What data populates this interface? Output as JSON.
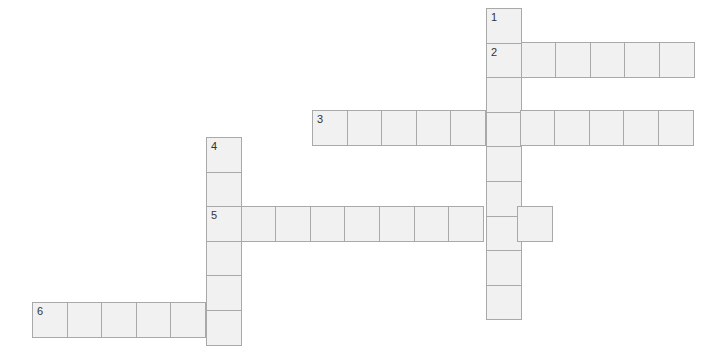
{
  "puzzle": {
    "type": "crossword",
    "cell_size": 34.6,
    "colors": {
      "cell_fill": "#f1f1f1",
      "cell_border": "#a9a9a9",
      "background": "#ffffff",
      "number": "#333333"
    },
    "entries": [
      {
        "number": "1",
        "direction": "down",
        "x": 486,
        "y": 8,
        "length": 9
      },
      {
        "number": "2",
        "direction": "across",
        "x": 486,
        "y": 42,
        "length": 6
      },
      {
        "number": "3",
        "direction": "across",
        "x": 312,
        "y": 110,
        "length": 11
      },
      {
        "number": "4",
        "direction": "down",
        "x": 206,
        "y": 137,
        "length": 6
      },
      {
        "number": "5",
        "direction": "across",
        "x": 206,
        "y": 206,
        "length": 10
      },
      {
        "number": "6",
        "direction": "across",
        "x": 32,
        "y": 302,
        "length": 6
      }
    ]
  }
}
